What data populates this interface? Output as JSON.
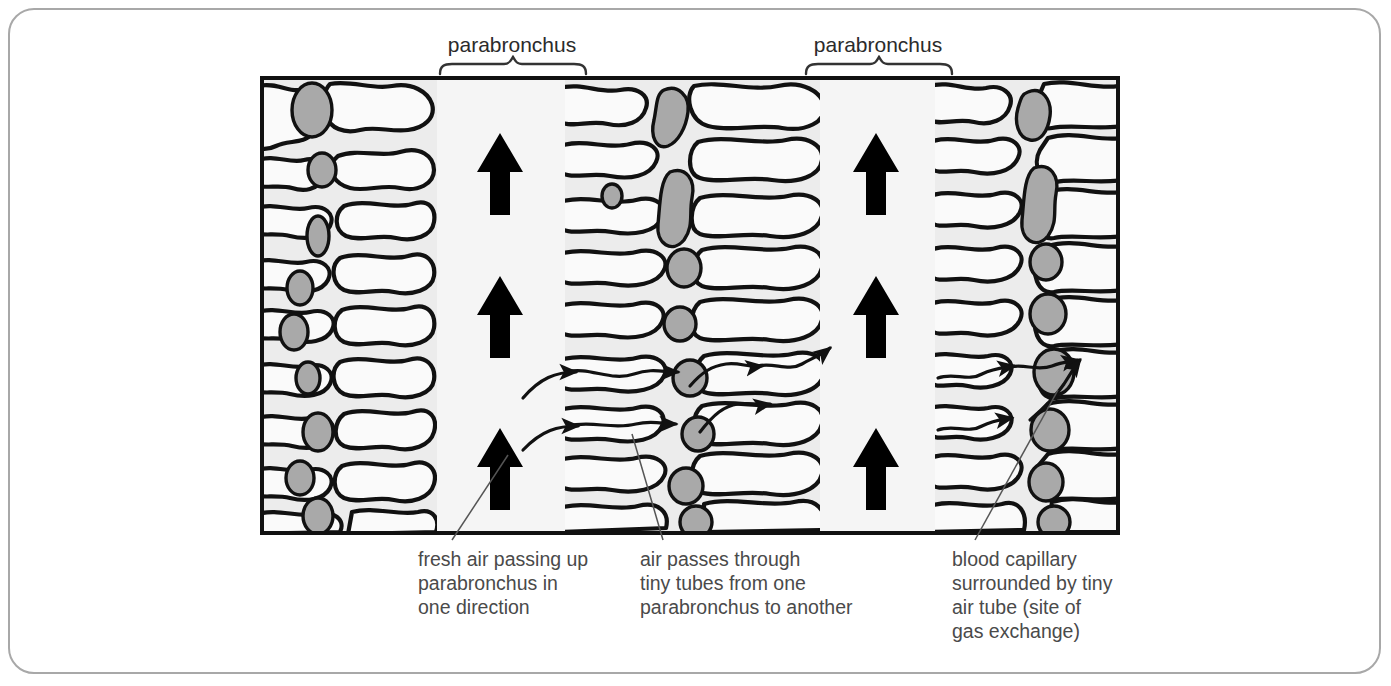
{
  "figure": {
    "kind": "biology-diagram",
    "frame_border_color": "#a8a8a8",
    "background_color": "#ffffff"
  },
  "colors": {
    "tissue_background": "#ececec",
    "air_tube_fill": "#fafafa",
    "parabronchus_channel": "#f5f5f5",
    "capillary_fill": "#a9a9a9",
    "outline": "#111111",
    "arrow": "#000000",
    "text": "#4a4a4a",
    "leader_line": "#555555"
  },
  "top_labels": [
    {
      "id": "parabronchus-left",
      "text": "parabronchus",
      "x": 512,
      "y": 52,
      "brace_x1": 440,
      "brace_x2": 586,
      "brace_y": 72
    },
    {
      "id": "parabronchus-right",
      "text": "parabronchus",
      "x": 878,
      "y": 52,
      "brace_x1": 806,
      "brace_x2": 952,
      "brace_y": 72
    }
  ],
  "captions": [
    {
      "id": "fresh-air-caption",
      "lines": [
        "fresh air passing up",
        "parabronchus in",
        "one direction"
      ],
      "x": 418,
      "y": 566,
      "leader": {
        "x1": 508,
        "y1": 455,
        "x2": 452,
        "y2": 540
      }
    },
    {
      "id": "air-passes-caption",
      "lines": [
        "air passes through",
        "tiny tubes from one",
        "parabronchus to another"
      ],
      "x": 640,
      "y": 566,
      "leader": {
        "x1": 632,
        "y1": 434,
        "x2": 663,
        "y2": 540
      }
    },
    {
      "id": "blood-capillary-caption",
      "lines": [
        "blood capillary",
        "surrounded by tiny",
        "air tube (site of",
        "gas exchange)"
      ],
      "x": 952,
      "y": 566,
      "leader": {
        "x1": 1058,
        "y1": 390,
        "x2": 975,
        "y2": 540
      }
    }
  ],
  "diagram_box": {
    "x": 262,
    "y": 78,
    "width": 856,
    "height": 455
  },
  "columns": [
    {
      "id": "tissue-left",
      "type": "tissue",
      "x": 262,
      "width": 175
    },
    {
      "id": "channel-left",
      "type": "parabronchus",
      "x": 437,
      "width": 128
    },
    {
      "id": "tissue-middle",
      "type": "tissue",
      "x": 565,
      "width": 255
    },
    {
      "id": "channel-right",
      "type": "parabronchus",
      "x": 820,
      "width": 115
    },
    {
      "id": "tissue-right",
      "type": "tissue",
      "x": 935,
      "width": 183
    }
  ],
  "airflow_arrows": [
    {
      "id": "big-arrow-left-top",
      "x": 500,
      "y": 175,
      "direction": "up"
    },
    {
      "id": "big-arrow-left-mid",
      "x": 500,
      "y": 318,
      "direction": "up"
    },
    {
      "id": "big-arrow-left-bottom",
      "x": 500,
      "y": 470,
      "direction": "up"
    },
    {
      "id": "big-arrow-right-top",
      "x": 876,
      "y": 175,
      "direction": "up"
    },
    {
      "id": "big-arrow-right-mid",
      "x": 876,
      "y": 318,
      "direction": "up"
    },
    {
      "id": "big-arrow-right-bottom",
      "x": 876,
      "y": 470,
      "direction": "up"
    }
  ],
  "cross_flow_arrow_count": 9,
  "capillary_count": 26,
  "air_tube_count": 38
}
